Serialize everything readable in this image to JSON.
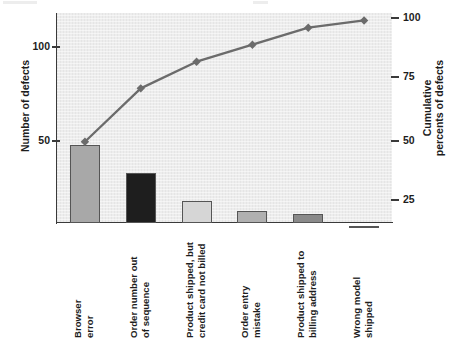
{
  "chart_data": {
    "type": "bar",
    "title": "",
    "subtitle": "",
    "xlabel": "",
    "ylabel": "Number of defects",
    "y2label": "Cumulative percents of defects",
    "grid": false,
    "legend": "none",
    "categories": [
      "Browser error",
      "Order number out of sequence",
      "Product shipped, but credit card not billed",
      "Order entry mistake",
      "Product shipped to billing address",
      "Wrong model shipped"
    ],
    "category_lines": [
      [
        "Browser",
        "error"
      ],
      [
        "Order number out",
        "of sequence"
      ],
      [
        "Product shipped, but",
        "credit card not billed"
      ],
      [
        "Order entry",
        "mistake"
      ],
      [
        "Product shipped to",
        "billing address"
      ],
      [
        "Wrong model",
        "shipped"
      ]
    ],
    "series": [
      {
        "name": "Number of defects",
        "type": "bar",
        "axis": "left",
        "values": [
          48,
          33,
          18,
          13,
          11,
          5
        ],
        "colors": [
          "#a8a8a8",
          "#1e1e1e",
          "#d6d6d6",
          "#b0b0b0",
          "#8a8a8a",
          "#9a9a9a"
        ]
      },
      {
        "name": "Cumulative percents of defects",
        "type": "line",
        "axis": "right",
        "values": [
          49,
          71,
          82,
          89,
          96,
          99
        ],
        "color": "#6b6b6b",
        "marker": "diamond"
      }
    ],
    "ylim": [
      0,
      127
    ],
    "yticks": [
      50,
      100
    ],
    "yticklabels": [
      "50",
      "100"
    ],
    "y2lim": [
      0,
      103
    ],
    "y2ticks": [
      25,
      50,
      75,
      100
    ],
    "y2ticklabels": [
      "25",
      "50",
      "75",
      "100"
    ]
  },
  "axes": {
    "left": {
      "title": "Number of defects",
      "ticks": [
        {
          "label": "100",
          "y": 47
        },
        {
          "label": "50",
          "y": 141
        }
      ]
    },
    "right": {
      "title_line1": "Cumulative",
      "title_line2": "percents of defects",
      "ticks": [
        {
          "label": "100",
          "y": 18
        },
        {
          "label": "75",
          "y": 77
        },
        {
          "label": "50",
          "y": 141
        },
        {
          "label": "25",
          "y": 200
        }
      ]
    }
  },
  "colors": {
    "panel_background": "#ededed",
    "page_background": "#ffffff",
    "axis": "#3a3a3a",
    "text": "#1d1d1d",
    "line_series": "#6b6b6b"
  }
}
